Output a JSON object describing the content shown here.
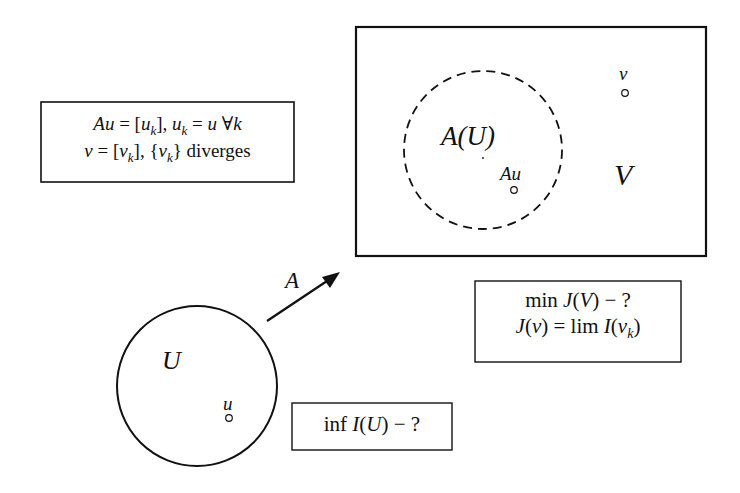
{
  "diagram": {
    "space_V": {
      "label": "V",
      "image_set_label": "A(U)",
      "image_point_label": "Au",
      "point_v_label": "v"
    },
    "space_U": {
      "label": "U",
      "point_u_label": "u"
    },
    "mapping": {
      "label": "A"
    },
    "definition_box": {
      "line1_a": "Au",
      "line1_b": " = [",
      "line1_c": "u",
      "line1_d": "k",
      "line1_e": "],  ",
      "line1_f": "u",
      "line1_g": "k",
      "line1_h": " = ",
      "line1_i": "u",
      "line1_j": " ∀",
      "line1_k": "k",
      "line2_a": "v",
      "line2_b": " = [",
      "line2_c": "v",
      "line2_d": "k",
      "line2_e": "], {",
      "line2_f": "v",
      "line2_g": "k",
      "line2_h": "} diverges"
    },
    "min_box": {
      "line1_a": "min ",
      "line1_b": "J",
      "line1_c": "(",
      "line1_d": "V",
      "line1_e": ") − ?",
      "line2_a": "J",
      "line2_b": "(",
      "line2_c": "v",
      "line2_d": ") = lim ",
      "line2_e": "I",
      "line2_f": "(",
      "line2_g": "v",
      "line2_h": "k",
      "line2_i": ")"
    },
    "inf_box": {
      "a": "inf ",
      "b": "I",
      "c": "(",
      "d": "U",
      "e": ") − ?"
    }
  }
}
